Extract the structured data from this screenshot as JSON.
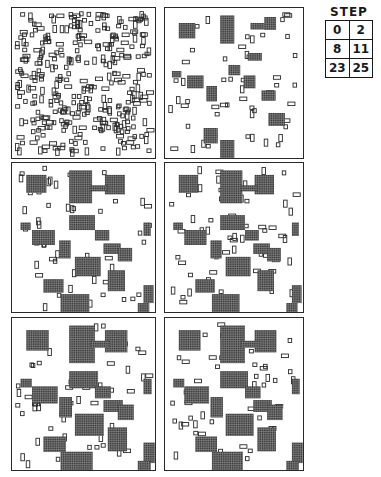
{
  "figure": {
    "panels": [
      {
        "step": 0,
        "label": "Step 0"
      },
      {
        "step": 2,
        "label": "Step 2"
      },
      {
        "step": 8,
        "label": "Step 8"
      },
      {
        "step": 11,
        "label": "Step 11"
      },
      {
        "step": 23,
        "label": "Step 23"
      },
      {
        "step": 25,
        "label": "Step 25"
      }
    ]
  },
  "legend": {
    "title": "STEP",
    "rows": [
      [
        "0",
        "2"
      ],
      [
        "8",
        "11"
      ],
      [
        "23",
        "25"
      ]
    ]
  },
  "colors": {
    "ink": "#2a2a2a",
    "background": "#ffffff"
  }
}
